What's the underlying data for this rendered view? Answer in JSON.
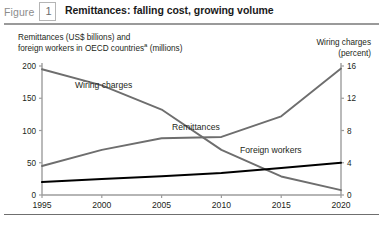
{
  "header": {
    "figure_word": "Figure",
    "figure_number": "1",
    "title": "Remittances: falling cost, growing volume"
  },
  "captions": {
    "left_line1": "Remittances (US$ billions) and",
    "left_line2_pre": "foreign workers in OECD countries",
    "left_line2_sup": "a",
    "left_line2_post": " (millions)",
    "right_line1": "Wiring charges",
    "right_line2": "(percent)"
  },
  "chart_data": {
    "type": "line",
    "title": "Remittances: falling cost, growing volume",
    "xlabel": "",
    "ylabel": "Remittances (US$ billions) and foreign workers in OECD countries (millions)",
    "y2label": "Wiring charges (percent)",
    "grid": false,
    "legend": "inline-labels",
    "x": [
      1995,
      2000,
      2005,
      2010,
      2015,
      2020
    ],
    "xlim": [
      1995,
      2020
    ],
    "xticks": [
      "1995",
      "2000",
      "2005",
      "2010",
      "2015",
      "2020"
    ],
    "ylim": [
      0,
      200
    ],
    "yticks": [
      "0",
      "50",
      "100",
      "150",
      "200"
    ],
    "ytickvalues": [
      0,
      50,
      100,
      150,
      200
    ],
    "y2lim": [
      0,
      16
    ],
    "y2ticks": [
      "0",
      "4",
      "8",
      "12",
      "16"
    ],
    "y2tickvalues": [
      0,
      4,
      8,
      12,
      16
    ],
    "series": [
      {
        "name": "Wiring charges",
        "axis": "right",
        "units": "percent",
        "color": "#6e6e6e",
        "x": [
          1995,
          2000,
          2005,
          2010,
          2015,
          2020
        ],
        "values": [
          15.6,
          13.6,
          10.6,
          5.6,
          2.3,
          0.6
        ]
      },
      {
        "name": "Remittances",
        "axis": "left",
        "units": "US$ billions",
        "color": "#6e6e6e",
        "x": [
          1995,
          2000,
          2005,
          2010,
          2015,
          2020
        ],
        "values": [
          45,
          70,
          88,
          90,
          122,
          196
        ]
      },
      {
        "name": "Foreign workers",
        "axis": "left",
        "units": "millions",
        "color": "#000000",
        "x": [
          1995,
          2000,
          2005,
          2010,
          2015,
          2020
        ],
        "values": [
          20,
          25,
          29,
          34,
          42,
          50
        ]
      }
    ],
    "series_label_positions": [
      {
        "name": "Wiring charges",
        "x": 75,
        "y": 88
      },
      {
        "name": "Remittances",
        "x": 172,
        "y": 130
      },
      {
        "name": "Foreign workers",
        "x": 240,
        "y": 153
      }
    ]
  }
}
